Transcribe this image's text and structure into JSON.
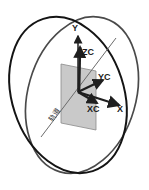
{
  "figure": {
    "background_color": "#ffffff",
    "width": 149,
    "height": 190
  },
  "colors": {
    "ellipse_stroke_front": "#141414",
    "ellipse_stroke_back": "#595959",
    "plane_fill": "#c6c6c6",
    "plane_stroke": "#8a8a8a",
    "axis_stroke": "#1f1f1f",
    "thin_line": "#6b6b6b",
    "label_color": "#1a1a1a"
  },
  "rings": [
    {
      "name": "orbit-ring-outer-left",
      "cx": 68,
      "cy": 95,
      "rx": 56,
      "ry": 80,
      "rotation": -18,
      "stroke": "#141414"
    },
    {
      "name": "orbit-ring-outer-right",
      "cx": 82,
      "cy": 95,
      "rx": 54,
      "ry": 80,
      "rotation": 16,
      "stroke": "#4a4a4a"
    }
  ],
  "plane": {
    "name": "reference-plane",
    "points": "61,64 96,71 96,130 61,123",
    "fill": "#c6c6c6",
    "opacity": 0.95
  },
  "origin": {
    "x": 78,
    "y": 92
  },
  "axes": [
    {
      "name": "axis-y",
      "label": "Y",
      "tip_x": 78,
      "tip_y": 33,
      "label_x": 72,
      "label_y": 31
    },
    {
      "name": "axis-zc",
      "label": "ZC",
      "tip_x": 80,
      "tip_y": 44,
      "label_x": 82,
      "label_y": 54
    },
    {
      "name": "axis-yc",
      "label": "YC",
      "tip_x": 104,
      "tip_y": 79,
      "label_x": 99,
      "label_y": 79
    },
    {
      "name": "axis-x",
      "label": "X",
      "tip_x": 121,
      "tip_y": 106,
      "label_x": 119,
      "label_y": 112
    },
    {
      "name": "axis-xc",
      "label": "XC",
      "tip_x": 99,
      "tip_y": 104,
      "label_x": 88,
      "label_y": 112
    }
  ],
  "diagonal_line": {
    "name": "orbit-trace-line",
    "x1": 41,
    "y1": 137,
    "x2": 116,
    "y2": 38
  },
  "annotation": {
    "name": "plane-annotation",
    "text": "轨道",
    "x": 52,
    "y": 122,
    "rotation": -52
  }
}
